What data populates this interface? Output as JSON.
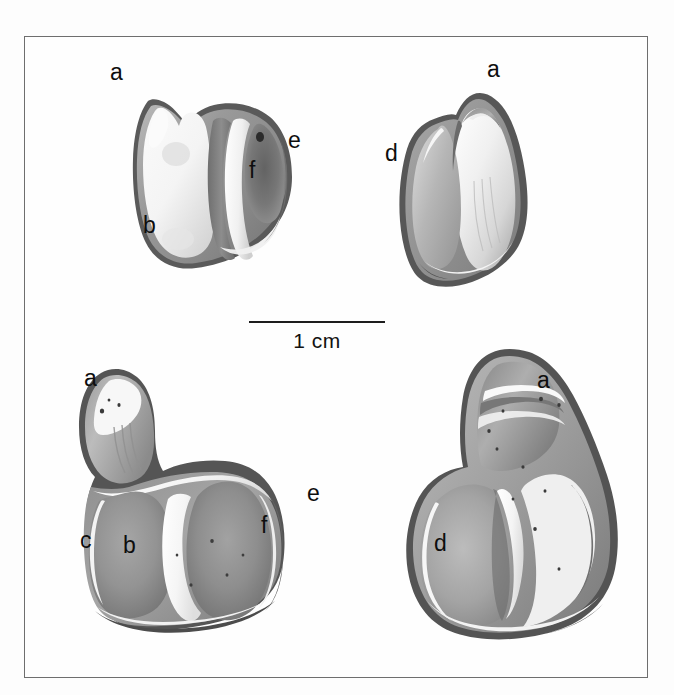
{
  "figure": {
    "type": "scientific-specimen-plate",
    "background_color": "#fdfdfd",
    "frame_color": "#6e6e6e",
    "label_color": "#0e0e0e"
  },
  "scale_bar": {
    "label": "1 cm",
    "length_px": 136,
    "line_color": "#1d1d1d"
  },
  "specimens": [
    {
      "id": "upper-left",
      "view": "occlusal",
      "labels": [
        {
          "text": "a",
          "x": 109,
          "y": 60
        },
        {
          "text": "b",
          "x": 142,
          "y": 213
        },
        {
          "text": "e",
          "x": 287,
          "y": 128
        },
        {
          "text": "f",
          "x": 248,
          "y": 158
        }
      ]
    },
    {
      "id": "upper-right",
      "view": "lingual",
      "labels": [
        {
          "text": "a",
          "x": 486,
          "y": 57
        },
        {
          "text": "d",
          "x": 384,
          "y": 141
        }
      ]
    },
    {
      "id": "lower-left",
      "view": "occlusal",
      "labels": [
        {
          "text": "a",
          "x": 83,
          "y": 366
        },
        {
          "text": "c",
          "x": 79,
          "y": 528
        },
        {
          "text": "b",
          "x": 122,
          "y": 533
        },
        {
          "text": "e",
          "x": 306,
          "y": 481
        },
        {
          "text": "f",
          "x": 260,
          "y": 513
        }
      ]
    },
    {
      "id": "lower-right",
      "view": "lingual",
      "labels": [
        {
          "text": "a",
          "x": 536,
          "y": 368
        },
        {
          "text": "d",
          "x": 433,
          "y": 531
        }
      ]
    }
  ]
}
